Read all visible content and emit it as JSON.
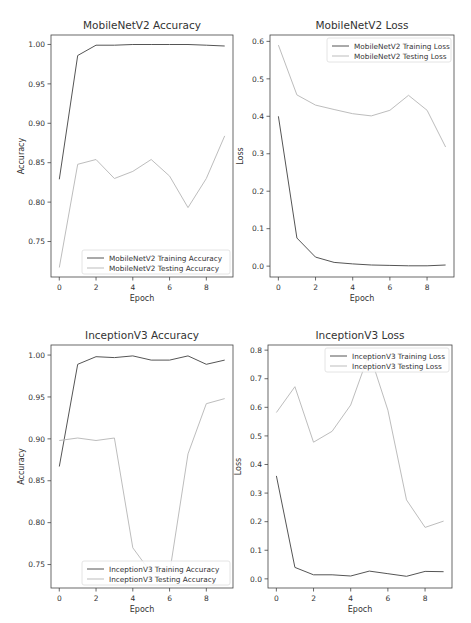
{
  "figure": {
    "width": 471,
    "height": 623,
    "colors": {
      "training": "#555555",
      "testing": "#bdbdbd",
      "axes": "#444444",
      "text": "#333333",
      "legend_border": "#dddddd"
    }
  },
  "chart_data": [
    {
      "id": "mobilenet-accuracy",
      "type": "line",
      "title": "MobileNetV2 Accuracy",
      "xlabel": "Epoch",
      "ylabel": "Accuracy",
      "xlim": [
        -0.45,
        9.45
      ],
      "ylim": [
        0.705,
        1.012
      ],
      "xticks": [
        0,
        2,
        4,
        6,
        8
      ],
      "xtick_labels": [
        "0",
        "2",
        "4",
        "6",
        "8"
      ],
      "yticks": [
        0.75,
        0.8,
        0.85,
        0.9,
        0.95,
        1.0
      ],
      "ytick_labels": [
        "0.75",
        "0.80",
        "0.85",
        "0.90",
        "0.95",
        "1.00"
      ],
      "grid": false,
      "legend_position": "lower right",
      "x": [
        0,
        1,
        2,
        3,
        4,
        5,
        6,
        7,
        8,
        9
      ],
      "series": [
        {
          "name": "MobileNetV2 Training Accuracy",
          "role": "training",
          "values": [
            0.829,
            0.986,
            0.999,
            0.999,
            1.0,
            1.0,
            1.0,
            1.0,
            0.999,
            0.998
          ]
        },
        {
          "name": "MobileNetV2 Testing Accuracy",
          "role": "testing",
          "values": [
            0.717,
            0.848,
            0.854,
            0.83,
            0.839,
            0.854,
            0.833,
            0.793,
            0.83,
            0.884
          ]
        }
      ],
      "box": {
        "left": 51,
        "top": 35,
        "right": 233,
        "bottom": 277
      }
    },
    {
      "id": "mobilenet-loss",
      "type": "line",
      "title": "MobileNetV2 Loss",
      "xlabel": "Epoch",
      "ylabel": "Loss",
      "xlim": [
        -0.45,
        9.45
      ],
      "ylim": [
        -0.029,
        0.617
      ],
      "xticks": [
        0,
        2,
        4,
        6,
        8
      ],
      "xtick_labels": [
        "0",
        "2",
        "4",
        "6",
        "8"
      ],
      "yticks": [
        0.0,
        0.1,
        0.2,
        0.3,
        0.4,
        0.5,
        0.6
      ],
      "ytick_labels": [
        "0.0",
        "0.1",
        "0.2",
        "0.3",
        "0.4",
        "0.5",
        "0.6"
      ],
      "grid": false,
      "legend_position": "upper right",
      "x": [
        0,
        1,
        2,
        3,
        4,
        5,
        6,
        7,
        8,
        9
      ],
      "series": [
        {
          "name": "MobileNetV2 Training Loss",
          "role": "training",
          "values": [
            0.4,
            0.075,
            0.024,
            0.01,
            0.006,
            0.003,
            0.002,
            0.001,
            0.001,
            0.003
          ]
        },
        {
          "name": "MobileNetV2 Testing Loss",
          "role": "testing",
          "values": [
            0.59,
            0.457,
            0.43,
            0.418,
            0.407,
            0.401,
            0.416,
            0.456,
            0.416,
            0.318
          ]
        }
      ],
      "box": {
        "left": 270,
        "top": 35,
        "right": 454,
        "bottom": 277
      }
    },
    {
      "id": "inception-accuracy",
      "type": "line",
      "title": "InceptionV3 Accuracy",
      "xlabel": "Epoch",
      "ylabel": "Accuracy",
      "xlim": [
        -0.45,
        9.45
      ],
      "ylim": [
        0.722,
        1.012
      ],
      "xticks": [
        0,
        2,
        4,
        6,
        8
      ],
      "xtick_labels": [
        "0",
        "2",
        "4",
        "6",
        "8"
      ],
      "yticks": [
        0.75,
        0.8,
        0.85,
        0.9,
        0.95,
        1.0
      ],
      "ytick_labels": [
        "0.75",
        "0.80",
        "0.85",
        "0.90",
        "0.95",
        "1.00"
      ],
      "grid": false,
      "legend_position": "lower right",
      "x": [
        0,
        1,
        2,
        3,
        4,
        5,
        6,
        7,
        8,
        9
      ],
      "series": [
        {
          "name": "InceptionV3 Training Accuracy",
          "role": "training",
          "values": [
            0.867,
            0.989,
            0.998,
            0.997,
            0.999,
            0.994,
            0.994,
            0.999,
            0.989,
            0.994
          ]
        },
        {
          "name": "InceptionV3 Testing Accuracy",
          "role": "testing",
          "values": [
            0.898,
            0.901,
            0.898,
            0.901,
            0.77,
            0.74,
            0.74,
            0.882,
            0.942,
            0.948
          ]
        }
      ],
      "box": {
        "left": 51,
        "top": 345,
        "right": 233,
        "bottom": 588
      }
    },
    {
      "id": "inception-loss",
      "type": "line",
      "title": "InceptionV3 Loss",
      "xlabel": "Epoch",
      "ylabel": "Loss",
      "xlim": [
        -0.45,
        9.45
      ],
      "ylim": [
        -0.032,
        0.818
      ],
      "xticks": [
        0,
        2,
        4,
        6,
        8
      ],
      "xtick_labels": [
        "0",
        "2",
        "4",
        "6",
        "8"
      ],
      "yticks": [
        0.0,
        0.1,
        0.2,
        0.3,
        0.4,
        0.5,
        0.6,
        0.7,
        0.8
      ],
      "ytick_labels": [
        "0.0",
        "0.1",
        "0.2",
        "0.3",
        "0.4",
        "0.5",
        "0.6",
        "0.7",
        "0.8"
      ],
      "grid": false,
      "legend_position": "upper right",
      "x": [
        0,
        1,
        2,
        3,
        4,
        5,
        6,
        7,
        8,
        9
      ],
      "series": [
        {
          "name": "InceptionV3 Training Loss",
          "role": "training",
          "values": [
            0.36,
            0.04,
            0.014,
            0.014,
            0.01,
            0.027,
            0.018,
            0.009,
            0.026,
            0.025
          ]
        },
        {
          "name": "InceptionV3 Testing Loss",
          "role": "testing",
          "values": [
            0.582,
            0.672,
            0.478,
            0.516,
            0.608,
            0.79,
            0.59,
            0.276,
            0.18,
            0.202
          ]
        }
      ],
      "box": {
        "left": 268,
        "top": 345,
        "right": 452,
        "bottom": 588
      }
    }
  ]
}
